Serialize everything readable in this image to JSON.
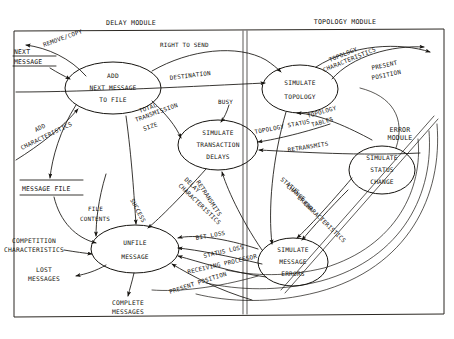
{
  "diagram": {
    "type": "data-flow-diagram",
    "modules": [
      {
        "id": "delay",
        "title": "DELAY MODULE"
      },
      {
        "id": "topology",
        "title": "TOPOLOGY MODULE"
      },
      {
        "id": "error",
        "title": "ERROR MODULE"
      }
    ],
    "processes": [
      {
        "id": "add-next-message-to-file",
        "lines": [
          "ADD",
          "NEXT MESSAGE",
          "TO FILE"
        ],
        "cx": 113,
        "cy": 88,
        "rx": 48,
        "ry": 26
      },
      {
        "id": "simulate-transaction-delays",
        "lines": [
          "SIMULATE",
          "TRANSACTION",
          "DELAYS"
        ],
        "cx": 218,
        "cy": 145,
        "rx": 40,
        "ry": 25
      },
      {
        "id": "simulate-topology",
        "lines": [
          "SIMULATE",
          "TOPOLOGY"
        ],
        "cx": 300,
        "cy": 89,
        "rx": 38,
        "ry": 24
      },
      {
        "id": "simulate-status-change",
        "lines": [
          "SIMULATE",
          "STATUS",
          "CHANGE"
        ],
        "cx": 382,
        "cy": 170,
        "rx": 33,
        "ry": 24
      },
      {
        "id": "simulate-message-errors",
        "lines": [
          "SIMULATE",
          "MESSAGE",
          "ERRORS"
        ],
        "cx": 293,
        "cy": 262,
        "rx": 35,
        "ry": 24
      },
      {
        "id": "unfile-message",
        "lines": [
          "UNFILE",
          "MESSAGE"
        ],
        "cx": 135,
        "cy": 249,
        "rx": 44,
        "ry": 24
      }
    ],
    "stores": [
      {
        "id": "next-message",
        "lines": [
          "NEXT",
          "MESSAGE"
        ],
        "x": 14,
        "y": 57
      },
      {
        "id": "message-file",
        "lines": [
          "MESSAGE FILE"
        ],
        "x": 22,
        "y": 186
      }
    ],
    "externals": [
      {
        "id": "competition-characteristics",
        "lines": [
          "COMPETITION",
          "CHARACTERISTICS"
        ],
        "x": 5,
        "y": 237
      },
      {
        "id": "lost-messages",
        "lines": [
          "LOST",
          "MESSAGES"
        ],
        "x": 30,
        "y": 270
      },
      {
        "id": "complete-messages",
        "lines": [
          "COMPLETE",
          "MESSAGES"
        ],
        "x": 102,
        "y": 304
      }
    ],
    "flows": [
      {
        "id": "remove-copy",
        "label": "REMOVE/COPY"
      },
      {
        "id": "next-message-flow",
        "label": "NEXT MESSAGE"
      },
      {
        "id": "right-to-send",
        "label": "RIGHT TO SEND"
      },
      {
        "id": "destination",
        "label": "DESTINATION"
      },
      {
        "id": "add-characteristics",
        "label": "ADD CHARACTERISTICS"
      },
      {
        "id": "total-transmission-size",
        "label": "TOTAL TRANSMISSION SIZE"
      },
      {
        "id": "busy",
        "label": "BUSY"
      },
      {
        "id": "topology-characteristics",
        "label": "TOPOLOGY CHARACTERISTICS"
      },
      {
        "id": "present-position-top",
        "label": "PRESENT POSITION"
      },
      {
        "id": "topology-tables",
        "label": "TOPOLOGY TABLES"
      },
      {
        "id": "topology-status",
        "label": "TOPOLOGY STATUS"
      },
      {
        "id": "retransmits-upper",
        "label": "RETRANSMITS"
      },
      {
        "id": "retransmits-lower",
        "label": "RETRANSMITS"
      },
      {
        "id": "status-change",
        "label": "STATUS CHANGE"
      },
      {
        "id": "error-characteristics",
        "label": "ERROR CHARACTERISTICS"
      },
      {
        "id": "delay-characteristics",
        "label": "DELAY CHARACTERISTICS"
      },
      {
        "id": "success",
        "label": "SUCCESS"
      },
      {
        "id": "file-contents",
        "label": "FILE CONTENTS"
      },
      {
        "id": "bit-loss",
        "label": "BIT LOSS"
      },
      {
        "id": "status-loss",
        "label": "STATUS LOSS"
      },
      {
        "id": "receiving-processor",
        "label": "RECEIVING PROCESSOR"
      },
      {
        "id": "present-position-bottom",
        "label": "PRESENT POSITION"
      }
    ],
    "labels": {
      "delay_module": "DELAY MODULE",
      "topology_module": "TOPOLOGY MODULE",
      "error_module_l1": "ERROR",
      "error_module_l2": "MODULE",
      "p1_l1": "ADD",
      "p1_l2": "NEXT MESSAGE",
      "p1_l3": "TO FILE",
      "p2_l1": "SIMULATE",
      "p2_l2": "TRANSACTION",
      "p2_l3": "DELAYS",
      "p3_l1": "SIMULATE",
      "p3_l2": "TOPOLOGY",
      "p4_l1": "SIMULATE",
      "p4_l2": "STATUS",
      "p4_l3": "CHANGE",
      "p5_l1": "SIMULATE",
      "p5_l2": "MESSAGE",
      "p5_l3": "ERRORS",
      "p6_l1": "UNFILE",
      "p6_l2": "MESSAGE",
      "store1_l1": "NEXT",
      "store1_l2": "MESSAGE",
      "store2_l1": "MESSAGE FILE",
      "ext1_l1": "COMPETITION",
      "ext1_l2": "CHARACTERISTICS",
      "ext2_l1": "LOST",
      "ext2_l2": "MESSAGES",
      "ext3_l1": "COMPLETE",
      "ext3_l2": "MESSAGES",
      "f_remove_copy": "REMOVE/COPY",
      "f_right_to_send": "RIGHT TO SEND",
      "f_destination": "DESTINATION",
      "f_add": "ADD",
      "f_characteristics": "CHARACTERISTICS",
      "f_total": "TOTAL",
      "f_transmission": "TRANSMISSION",
      "f_size": "SIZE",
      "f_busy": "BUSY",
      "f_topology": "TOPOLOGY",
      "f_characteristics2": "CHARACTERISTICS",
      "f_present": "PRESENT",
      "f_position": "POSITION",
      "f_topology2": "TOPOLOGY",
      "f_tables": "TABLES",
      "f_topology_status": "TOPOLOGY  STATUS",
      "f_retransmits_a": "RETRANSMITS",
      "f_retransmits_b": "RETRANSMITS",
      "f_status": "STATUS",
      "f_change": "CHANGE",
      "f_error": "ERROR",
      "f_characteristics3": "CHARACTERISTICS",
      "f_delay": "DELAY",
      "f_characteristics4": "CHARACTERISTICS",
      "f_success": "SUCCESS",
      "f_file": "FILE",
      "f_contents": "CONTENTS",
      "f_bit_loss": "BIT LOSS",
      "f_status_loss": "STATUS LOSS",
      "f_receiving_processor": "RECEIVING PROCESSOR",
      "f_present_position2": "PRESENT POSITION"
    },
    "colors": {
      "ink": "#15130f",
      "paper": "#ffffff"
    }
  }
}
